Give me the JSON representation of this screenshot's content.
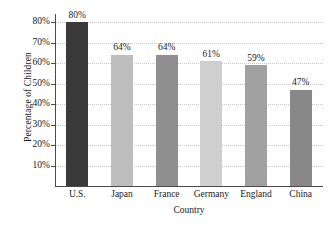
{
  "chart_data": {
    "type": "bar",
    "title": "",
    "xlabel": "Country",
    "ylabel": "Percentage of Children",
    "categories": [
      "U.S.",
      "Japan",
      "France",
      "Germany",
      "England",
      "China"
    ],
    "values": [
      80,
      64,
      64,
      61,
      59,
      47
    ],
    "value_labels": [
      "80%",
      "64%",
      "64%",
      "61%",
      "59%",
      "47%"
    ],
    "bar_colors": [
      "#3a3a3a",
      "#bdbdbd",
      "#8f8f8f",
      "#cfcfcf",
      "#a0a0a0",
      "#888888"
    ],
    "ylim": [
      0,
      84
    ],
    "ytick_values": [
      10,
      20,
      30,
      40,
      50,
      60,
      70,
      80
    ],
    "ytick_labels": [
      "10%",
      "20%",
      "30%",
      "40%",
      "50%",
      "60%",
      "70%",
      "80%"
    ],
    "grid": true,
    "grid_axis": "y",
    "legend": "none",
    "axis_color": "#4a4a4a",
    "grid_color": "#c8c8c8",
    "background": "#ffffff"
  },
  "axes": {
    "x_title": "Country",
    "y_title": "Percentage of Children"
  }
}
